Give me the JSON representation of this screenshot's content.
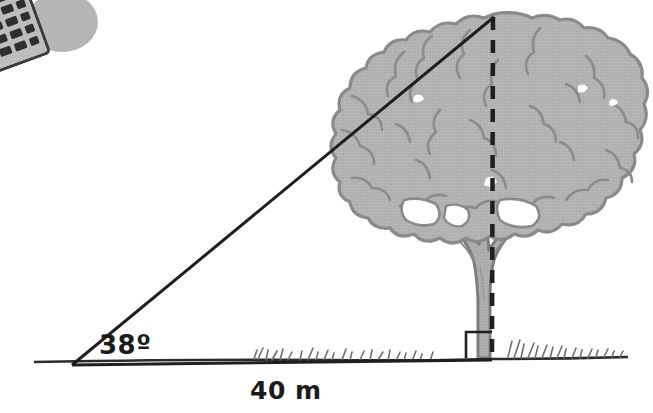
{
  "figure": {
    "kind": "trigonometry-diagram",
    "background_color": "#ffffff"
  },
  "labels": {
    "angle": "38º",
    "baseline": "40 m"
  },
  "geometry": {
    "observer_vertex": {
      "x": 72,
      "y": 365
    },
    "tree_base_vertex": {
      "x": 492,
      "y": 358
    },
    "treetop_vertex": {
      "x": 494,
      "y": 17
    },
    "angle_degrees": 38,
    "baseline_length_m": 40,
    "right_angle_marker": {
      "x": 466,
      "y": 332,
      "size": 26
    }
  },
  "colors": {
    "line": "#1f1f1f",
    "ground": "#2b2b2b",
    "foliage_fill": "#b3b3b3",
    "foliage_outline": "#8a8a8a",
    "trunk_fill": "#adadad",
    "trunk_outline": "#7d7d7d",
    "grass": "#6e6e6e",
    "calculator_body": "#b8b8b8",
    "calculator_keys": "#2f2f2f",
    "shadow": "#b5b5b5"
  },
  "elements": {
    "calculator_name": "calculator",
    "tree_name": "tree",
    "ground_name": "ground-line",
    "hypotenuse_name": "line-of-sight",
    "height_line_name": "tree-height-dashed-line"
  }
}
